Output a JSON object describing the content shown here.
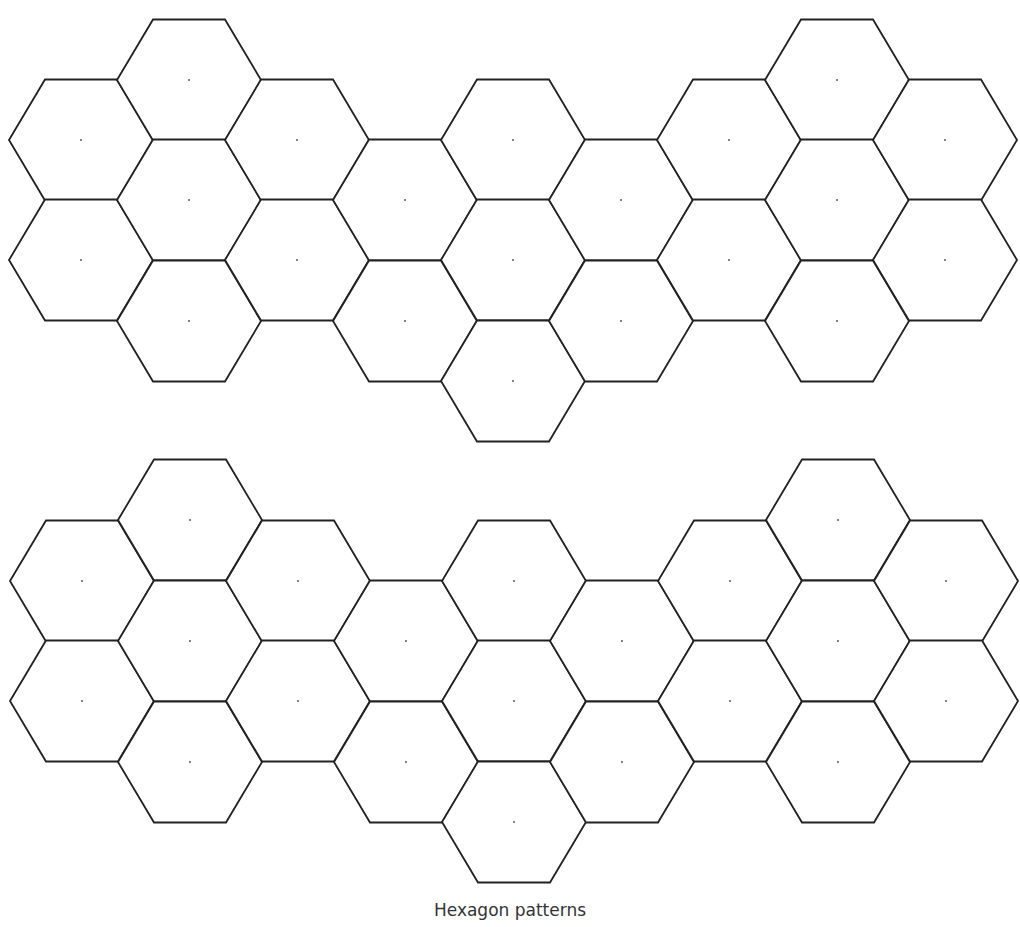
{
  "caption": "Hexagon patterns",
  "geometry": {
    "radius": 72,
    "half_height": 60.5,
    "stroke_color": "#222222",
    "background": "#ffffff"
  },
  "patterns": [
    {
      "name": "top-pattern",
      "hexagons": [
        [
          81,
          140
        ],
        [
          81,
          260
        ],
        [
          189,
          80
        ],
        [
          189,
          200
        ],
        [
          189,
          321
        ],
        [
          297,
          140
        ],
        [
          297,
          260
        ],
        [
          405,
          200
        ],
        [
          405,
          321
        ],
        [
          513,
          140
        ],
        [
          513,
          260
        ],
        [
          513,
          381
        ],
        [
          621,
          200
        ],
        [
          621,
          321
        ],
        [
          729,
          140
        ],
        [
          729,
          260
        ],
        [
          837,
          80
        ],
        [
          837,
          200
        ],
        [
          837,
          321
        ],
        [
          945,
          140
        ],
        [
          945,
          260
        ]
      ]
    },
    {
      "name": "bottom-pattern",
      "hexagons": [
        [
          82,
          581
        ],
        [
          82,
          701
        ],
        [
          190,
          520
        ],
        [
          190,
          641
        ],
        [
          190,
          762
        ],
        [
          298,
          581
        ],
        [
          298,
          701
        ],
        [
          406,
          641
        ],
        [
          406,
          762
        ],
        [
          514,
          581
        ],
        [
          514,
          701
        ],
        [
          514,
          822
        ],
        [
          622,
          641
        ],
        [
          622,
          762
        ],
        [
          730,
          581
        ],
        [
          730,
          701
        ],
        [
          838,
          520
        ],
        [
          838,
          641
        ],
        [
          838,
          762
        ],
        [
          946,
          581
        ],
        [
          946,
          701
        ]
      ]
    }
  ]
}
